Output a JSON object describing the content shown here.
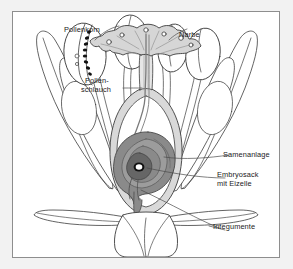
{
  "diagram": {
    "language": "de",
    "frame_color": "#8e8e8e",
    "page_background": "#f2f2f2",
    "canvas_background": "#ffffff",
    "line_color": "#3c3c3c",
    "label_color": "#1a1a1a"
  },
  "labels": [
    {
      "id": "pollenkorn",
      "text": "Pollenkorn",
      "x": 63,
      "y": 18
    },
    {
      "id": "narbe",
      "text": "Narbe",
      "x": 178,
      "y": 24
    },
    {
      "id": "pollen-1",
      "text": "Pollen-",
      "x": 84,
      "y": 70
    },
    {
      "id": "pollen-2",
      "text": "schlauch",
      "x": 80,
      "y": 79
    },
    {
      "id": "samenanlage",
      "text": "Samenanlage",
      "x": 222,
      "y": 152
    },
    {
      "id": "embryosack-1",
      "text": "Embryosack",
      "x": 216,
      "y": 172
    },
    {
      "id": "embryosack-2",
      "text": "mit Eizelle",
      "x": 216,
      "y": 181
    },
    {
      "id": "integumente",
      "text": "Integumente",
      "x": 212,
      "y": 224
    }
  ],
  "parts": {
    "petals": {
      "name": "Blütenblätter",
      "count": 6,
      "fill": "#ffffff",
      "stroke": "#3c3c3c"
    },
    "sepals": {
      "name": "Kelchblätter",
      "count": 4,
      "fill": "#ffffff",
      "stroke": "#3c3c3c"
    },
    "anthers": {
      "name": "Staubbeutel",
      "count": 4,
      "fill": "#ffffff",
      "stroke": "#3c3c3c"
    },
    "pollen_grains": {
      "name": "Pollenkörner",
      "fill": "#111111",
      "count": 9
    },
    "stigma": {
      "name": "Narbe",
      "fill": "#d8d8d8",
      "stroke": "#3c3c3c"
    },
    "style": {
      "name": "Griffel",
      "fill": "#e3e3e3",
      "stroke": "#3c3c3c"
    },
    "pollen_tube": {
      "name": "Pollenschlauch",
      "stroke": "#6b6b6b"
    },
    "ovary": {
      "name": "Fruchtknoten",
      "fill": "#ededed",
      "wall": "#d4d4d4",
      "stroke": "#3c3c3c"
    },
    "ovule": {
      "name": "Samenanlage",
      "fill": "#8c8c8c",
      "stroke": "#4a4a4a"
    },
    "integuments": {
      "name": "Integumente",
      "fill": "#a8a8a8"
    },
    "embryo_sac": {
      "name": "Embryosack",
      "fill": "#6e6e6e"
    },
    "egg_cell": {
      "name": "Eizelle",
      "fill": "#ffffff",
      "stroke": "#000000"
    },
    "receptacle": {
      "name": "Blütenboden",
      "fill": "#ffffff",
      "stroke": "#3c3c3c"
    }
  }
}
